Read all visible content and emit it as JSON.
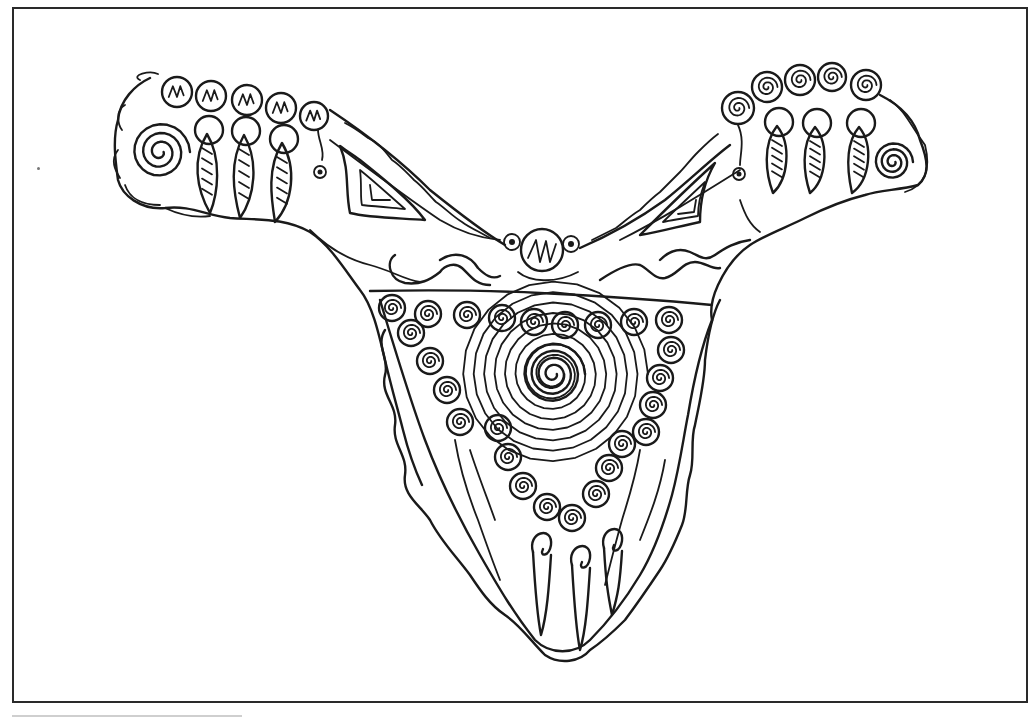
{
  "image": {
    "description": "Black-and-white line drawing of an ornamental Y-shaped pectoral/necklace decorated with spirals, hatched beads and dangling leaf-shaped pendants",
    "stroke_color": "#1a1a1a",
    "background_color": "#ffffff",
    "frame_color": "#2a2a2a"
  },
  "frame": {
    "x": 12,
    "y": 7,
    "width": 1016,
    "height": 696
  },
  "left_arm": {
    "hatched_beads": [
      {
        "cx": 177,
        "cy": 92,
        "r": 15
      },
      {
        "cx": 211,
        "cy": 96,
        "r": 15
      },
      {
        "cx": 247,
        "cy": 100,
        "r": 15
      },
      {
        "cx": 281,
        "cy": 108,
        "r": 15
      },
      {
        "cx": 314,
        "cy": 116,
        "r": 14
      }
    ],
    "pendants": [
      {
        "ring_cx": 209,
        "ring_cy": 130,
        "tip_x": 210,
        "tip_y": 213
      },
      {
        "ring_cx": 246,
        "ring_cy": 131,
        "tip_x": 240,
        "tip_y": 218
      },
      {
        "ring_cx": 284,
        "ring_cy": 139,
        "tip_x": 275,
        "tip_y": 222
      }
    ],
    "spiral": {
      "cx": 160,
      "cy": 152
    },
    "eye_dot": {
      "cx": 320,
      "cy": 172
    }
  },
  "right_arm": {
    "spiral_beads": [
      {
        "cx": 738,
        "cy": 108,
        "r": 16
      },
      {
        "cx": 767,
        "cy": 87,
        "r": 15
      },
      {
        "cx": 800,
        "cy": 80,
        "r": 15
      },
      {
        "cx": 832,
        "cy": 77,
        "r": 14
      },
      {
        "cx": 866,
        "cy": 85,
        "r": 15
      }
    ],
    "pendants": [
      {
        "ring_cx": 779,
        "ring_cy": 122,
        "tip_x": 773,
        "tip_y": 193
      },
      {
        "ring_cx": 817,
        "ring_cy": 123,
        "tip_x": 810,
        "tip_y": 193
      },
      {
        "ring_cx": 861,
        "ring_cy": 123,
        "tip_x": 852,
        "tip_y": 193
      }
    ],
    "spiral": {
      "cx": 893,
      "cy": 162
    },
    "eye_dot": {
      "cx": 739,
      "cy": 174
    }
  },
  "center_bead": {
    "cx": 542,
    "cy": 250,
    "r": 21
  },
  "side_small_beads": [
    {
      "cx": 512,
      "cy": 242,
      "r": 8
    },
    {
      "cx": 571,
      "cy": 244,
      "r": 8
    }
  ],
  "bib": {
    "top_row_spirals": [
      {
        "cx": 392,
        "cy": 308
      },
      {
        "cx": 428,
        "cy": 314
      },
      {
        "cx": 467,
        "cy": 315
      },
      {
        "cx": 502,
        "cy": 318
      },
      {
        "cx": 534,
        "cy": 322
      },
      {
        "cx": 565,
        "cy": 325
      },
      {
        "cx": 598,
        "cy": 325
      },
      {
        "cx": 634,
        "cy": 322
      },
      {
        "cx": 669,
        "cy": 320
      }
    ],
    "left_chain_spirals": [
      {
        "cx": 411,
        "cy": 333
      },
      {
        "cx": 430,
        "cy": 361
      },
      {
        "cx": 447,
        "cy": 390
      },
      {
        "cx": 460,
        "cy": 422
      }
    ],
    "right_chain_spirals": [
      {
        "cx": 671,
        "cy": 350
      },
      {
        "cx": 660,
        "cy": 378
      },
      {
        "cx": 653,
        "cy": 405
      },
      {
        "cx": 646,
        "cy": 432
      }
    ],
    "inner_v_spirals": [
      {
        "cx": 498,
        "cy": 428
      },
      {
        "cx": 508,
        "cy": 457
      },
      {
        "cx": 523,
        "cy": 486
      },
      {
        "cx": 547,
        "cy": 507
      },
      {
        "cx": 572,
        "cy": 518
      },
      {
        "cx": 596,
        "cy": 494
      },
      {
        "cx": 609,
        "cy": 468
      },
      {
        "cx": 622,
        "cy": 444
      }
    ],
    "central_spiral": {
      "cx": 553,
      "cy": 374
    },
    "bottom_pendants": [
      {
        "x": 541,
        "top": 527,
        "bottom": 635
      },
      {
        "x": 580,
        "top": 540,
        "bottom": 650
      },
      {
        "x": 612,
        "top": 523,
        "bottom": 615
      }
    ]
  }
}
